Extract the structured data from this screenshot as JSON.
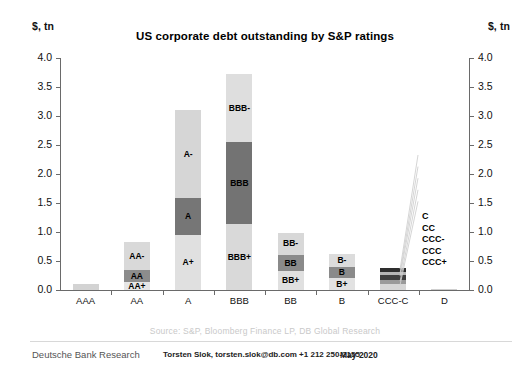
{
  "header": {
    "title": "US corporate debt outstanding by S&P ratings",
    "unit_left": "$, tn",
    "unit_right": "$, tn"
  },
  "footer": {
    "source": "Source: S&P, Bloomberg Finance LP, DB Global Research",
    "publisher": "Deutsche Bank Research",
    "contact": "Torsten Slok, torsten.slok@db.com  +1 212 250-2155",
    "date": "May 2020"
  },
  "chart_data": {
    "type": "bar",
    "subtype": "stacked",
    "title": "US corporate debt outstanding by S&P ratings",
    "xlabel": "",
    "ylabel": "$, tn",
    "ylim": [
      0.0,
      4.0
    ],
    "yticks": [
      "0.0",
      "0.5",
      "1.0",
      "1.5",
      "2.0",
      "2.5",
      "3.0",
      "3.5",
      "4.0"
    ],
    "ytick_values": [
      0.0,
      0.5,
      1.0,
      1.5,
      2.0,
      2.5,
      3.0,
      3.5,
      4.0
    ],
    "grid": false,
    "legend": "none",
    "dual_axis": true,
    "categories": [
      "AAA",
      "AA",
      "A",
      "BBB",
      "BB",
      "B",
      "CCC-C",
      "D"
    ],
    "totals": [
      0.11,
      0.83,
      3.11,
      3.72,
      0.99,
      0.62,
      0.38,
      0.02
    ],
    "bars": [
      {
        "category": "AAA",
        "total": 0.11,
        "segments": [
          {
            "label": "AAA",
            "value": 0.11,
            "color": "#d3d3d3",
            "show_label": false
          }
        ]
      },
      {
        "category": "AA",
        "total": 0.83,
        "segments": [
          {
            "label": "AA+",
            "value": 0.13,
            "color": "#e6e6e6",
            "show_label": true
          },
          {
            "label": "AA",
            "value": 0.22,
            "color": "#8c8c8c",
            "show_label": true
          },
          {
            "label": "AA-",
            "value": 0.48,
            "color": "#d9d9d9",
            "show_label": true
          }
        ]
      },
      {
        "category": "A",
        "total": 3.11,
        "segments": [
          {
            "label": "A+",
            "value": 0.95,
            "color": "#e0e0e0",
            "show_label": true
          },
          {
            "label": "A",
            "value": 0.63,
            "color": "#767676",
            "show_label": true
          },
          {
            "label": "A-",
            "value": 1.53,
            "color": "#d6d6d6",
            "show_label": true
          }
        ]
      },
      {
        "category": "BBB",
        "total": 3.72,
        "segments": [
          {
            "label": "BBB+",
            "value": 1.13,
            "color": "#d9d9d9",
            "show_label": true
          },
          {
            "label": "BBB",
            "value": 1.42,
            "color": "#737373",
            "show_label": true
          },
          {
            "label": "BBB-",
            "value": 1.17,
            "color": "#dedede",
            "show_label": true
          }
        ]
      },
      {
        "category": "BB",
        "total": 0.99,
        "segments": [
          {
            "label": "BB+",
            "value": 0.33,
            "color": "#e0e0e0",
            "show_label": true
          },
          {
            "label": "BB",
            "value": 0.28,
            "color": "#8a8a8a",
            "show_label": true
          },
          {
            "label": "BB-",
            "value": 0.38,
            "color": "#d8d8d8",
            "show_label": true
          }
        ]
      },
      {
        "category": "B",
        "total": 0.62,
        "segments": [
          {
            "label": "B+",
            "value": 0.2,
            "color": "#e2e2e2",
            "show_label": true
          },
          {
            "label": "B",
            "value": 0.2,
            "color": "#8a8a8a",
            "show_label": true
          },
          {
            "label": "B-",
            "value": 0.22,
            "color": "#dcdcdc",
            "show_label": true
          }
        ]
      },
      {
        "category": "CCC-C",
        "total": 0.38,
        "segments": [
          {
            "label": "CCC+",
            "value": 0.11,
            "color": "#d6d6d6",
            "show_label": false
          },
          {
            "label": "CCC",
            "value": 0.06,
            "color": "#9a9a9a",
            "show_label": false
          },
          {
            "label": "CCC-",
            "value": 0.09,
            "color": "#3f3f3f",
            "show_label": false
          },
          {
            "label": "CC",
            "value": 0.05,
            "color": "#b5b5b5",
            "show_label": false
          },
          {
            "label": "C",
            "value": 0.07,
            "color": "#2e2e2e",
            "show_label": false
          }
        ]
      },
      {
        "category": "D",
        "total": 0.02,
        "segments": [
          {
            "label": "D",
            "value": 0.02,
            "color": "#cfcfcf",
            "show_label": false
          }
        ]
      }
    ],
    "callouts": {
      "target_category": "CCC-C",
      "labels": [
        "C",
        "CC",
        "CCC-",
        "CCC",
        "CCC+"
      ]
    }
  }
}
